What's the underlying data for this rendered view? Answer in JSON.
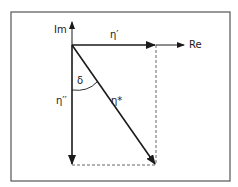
{
  "diagram": {
    "axes": {
      "imaginary_label": "Im",
      "real_label": "Re"
    },
    "vectors": {
      "storage_label": "η′",
      "loss_label": "η′′",
      "complex_label": "η*"
    },
    "angle_label": "δ",
    "colors": {
      "line": "#1a1a1a",
      "frame": "#555555",
      "dashed": "#666666"
    }
  }
}
